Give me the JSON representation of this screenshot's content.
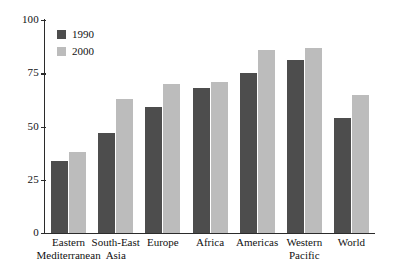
{
  "chart_data": {
    "type": "bar",
    "title": "",
    "subtitle": "",
    "xlabel": "",
    "ylabel": "",
    "ylim": [
      0,
      100
    ],
    "yticks": [
      0,
      25,
      50,
      75,
      100
    ],
    "grid": false,
    "legend_position": "top-left",
    "categories": [
      "Eastern\nMediterranean",
      "South-East\nAsia",
      "Europe",
      "Africa",
      "Americas",
      "Western\nPacific",
      "World"
    ],
    "series": [
      {
        "name": "1990",
        "color": "#4d4d4d",
        "values": [
          34,
          47,
          59,
          68,
          75,
          81,
          54
        ]
      },
      {
        "name": "2000",
        "color": "#bcbcbc",
        "values": [
          38,
          63,
          70,
          71,
          86,
          87,
          65
        ]
      }
    ]
  },
  "legend": {
    "items": [
      {
        "label": "1990",
        "color": "#4d4d4d"
      },
      {
        "label": "2000",
        "color": "#bcbcbc"
      }
    ]
  },
  "axis": {
    "y_tick_labels": [
      "100",
      "75",
      "50",
      "25",
      "0"
    ]
  }
}
